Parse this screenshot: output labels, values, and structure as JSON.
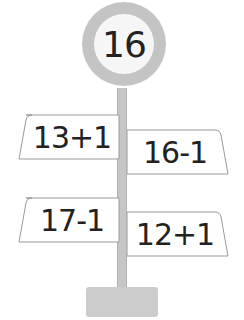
{
  "target": {
    "value": "16"
  },
  "signs": [
    {
      "expression": "13+1",
      "side": "left"
    },
    {
      "expression": "16-1",
      "side": "right"
    },
    {
      "expression": "17-1",
      "side": "left"
    },
    {
      "expression": "12+1",
      "side": "right"
    }
  ],
  "colors": {
    "pole": "#c6c6c6",
    "disc": "#c4c4c4",
    "disc_center": "#f6f6f6",
    "sign_border": "#999999"
  }
}
